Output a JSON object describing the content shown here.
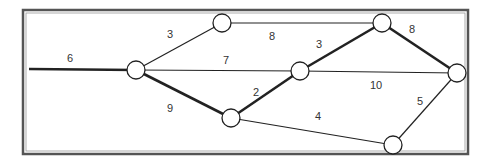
{
  "diagram": {
    "type": "weighted-graph",
    "frame": {
      "x": 23,
      "y": 10,
      "width": 445,
      "height": 144,
      "color": "#555555"
    },
    "nodes": [
      {
        "id": "A",
        "x": 136,
        "y": 70
      },
      {
        "id": "B",
        "x": 222,
        "y": 23
      },
      {
        "id": "C",
        "x": 231,
        "y": 118
      },
      {
        "id": "D",
        "x": 300,
        "y": 71
      },
      {
        "id": "E",
        "x": 382,
        "y": 23
      },
      {
        "id": "F",
        "x": 457,
        "y": 73
      },
      {
        "id": "G",
        "x": 393,
        "y": 145
      }
    ],
    "edges": [
      {
        "from": "start",
        "to": "A",
        "weight": "6",
        "thick": true,
        "label_x": 70,
        "label_y": 62
      },
      {
        "from": "A",
        "to": "B",
        "weight": "3",
        "thick": false,
        "label_x": 170,
        "label_y": 38
      },
      {
        "from": "B",
        "to": "E",
        "weight": "8",
        "thick": false,
        "label_x": 272,
        "label_y": 40
      },
      {
        "from": "A",
        "to": "D",
        "weight": "7",
        "thick": false,
        "label_x": 226,
        "label_y": 64
      },
      {
        "from": "A",
        "to": "C",
        "weight": "9",
        "thick": true,
        "label_x": 170,
        "label_y": 112
      },
      {
        "from": "C",
        "to": "D",
        "weight": "2",
        "thick": true,
        "label_x": 256,
        "label_y": 96
      },
      {
        "from": "D",
        "to": "E",
        "weight": "3",
        "thick": true,
        "label_x": 319,
        "label_y": 48
      },
      {
        "from": "E",
        "to": "F",
        "weight": "8",
        "thick": true,
        "label_x": 412,
        "label_y": 33
      },
      {
        "from": "D",
        "to": "F",
        "weight": "10",
        "thick": false,
        "label_x": 376,
        "label_y": 89
      },
      {
        "from": "C",
        "to": "G",
        "weight": "4",
        "thick": false,
        "label_x": 318,
        "label_y": 120
      },
      {
        "from": "G",
        "to": "F",
        "weight": "5",
        "thick": false,
        "label_x": 420,
        "label_y": 105
      }
    ],
    "start_point": {
      "x": 29,
      "y": 69
    }
  }
}
